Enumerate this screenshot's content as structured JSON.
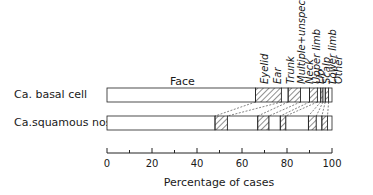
{
  "chart_data": {
    "type": "bar",
    "orientation": "horizontal-stacked",
    "title": "",
    "xlabel": "Percentage of cases",
    "ylabel": "",
    "xlim": [
      0,
      100
    ],
    "xticks": [
      0,
      20,
      40,
      60,
      80,
      100
    ],
    "xminor_ticks": [
      10,
      30,
      50,
      70,
      90
    ],
    "grid": false,
    "legend": "segment labels rotated above top bar",
    "categories": [
      "Ca. basal cell",
      "Ca.squamous nos"
    ],
    "segments": [
      "Face",
      "Eyelid",
      "Ear",
      "Trunk",
      "Multiple+unspec",
      "Neck",
      "Upper limb",
      "Lip",
      "Scalp",
      "Lower limb",
      "Other"
    ],
    "hatched": [
      false,
      true,
      false,
      true,
      false,
      true,
      false,
      true,
      false,
      true,
      false
    ],
    "series": [
      {
        "name": "Face",
        "values": [
          66.0,
          48.0
        ]
      },
      {
        "name": "Eyelid",
        "values": [
          11.5,
          5.5
        ]
      },
      {
        "name": "Ear",
        "values": [
          3.0,
          13.5
        ]
      },
      {
        "name": "Trunk",
        "values": [
          5.5,
          5.0
        ]
      },
      {
        "name": "Multiple+unspec",
        "values": [
          4.0,
          5.0
        ]
      },
      {
        "name": "Neck",
        "values": [
          3.5,
          2.5
        ]
      },
      {
        "name": "Upper limb",
        "values": [
          1.5,
          10.0
        ]
      },
      {
        "name": "Lip",
        "values": [
          1.0,
          3.5
        ]
      },
      {
        "name": "Scalp",
        "values": [
          1.0,
          2.5
        ]
      },
      {
        "name": "Lower limb",
        "values": [
          1.5,
          2.5
        ]
      },
      {
        "name": "Other",
        "values": [
          1.5,
          2.0
        ]
      }
    ],
    "cumulative_boundaries": {
      "Ca. basal cell": [
        0,
        66,
        77.5,
        80.5,
        86,
        90,
        93.5,
        95,
        96,
        97,
        98.5,
        100
      ],
      "Ca.squamous nos": [
        0,
        48,
        53.5,
        67,
        72,
        77,
        79.5,
        89.5,
        93,
        95.5,
        98,
        100
      ]
    }
  },
  "labels": {
    "row1": "Ca. basal cell",
    "row2": "Ca.squamous nos",
    "face": "Face",
    "xlabel": "Percentage of cases",
    "ticks": [
      "0",
      "20",
      "40",
      "60",
      "80",
      "100"
    ],
    "rotated": [
      "Eyelid",
      "Ear",
      "Trunk",
      "Multiple+unspec",
      "Neck",
      "Upper limb",
      "Lip",
      "Scalp",
      "Lower limb",
      "Other"
    ]
  }
}
